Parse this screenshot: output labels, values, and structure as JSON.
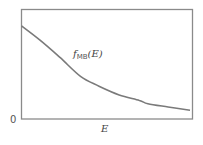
{
  "chart_data": {
    "type": "line",
    "title": "",
    "xlabel": "E",
    "ylabel": "",
    "y_origin_tick": "0",
    "series": [
      {
        "name": "f_MB(E)",
        "label_main": "f",
        "label_sub": "MB",
        "label_arg": "(E)",
        "description": "Maxwell-Boltzmann distribution, decaying exponential",
        "x": [
          0,
          0.11,
          0.23,
          0.35,
          0.46,
          0.58,
          0.7,
          0.75,
          0.87,
          1.0
        ],
        "y": [
          0.85,
          0.72,
          0.56,
          0.39,
          0.3,
          0.22,
          0.17,
          0.14,
          0.11,
          0.08
        ]
      }
    ],
    "xlim": [
      0,
      1
    ],
    "ylim": [
      0,
      1
    ],
    "grid": false,
    "legend": "inline label"
  },
  "colors": {
    "frame": "#8a8a8a",
    "curve": "#7a7a7a",
    "text": "#444444"
  }
}
